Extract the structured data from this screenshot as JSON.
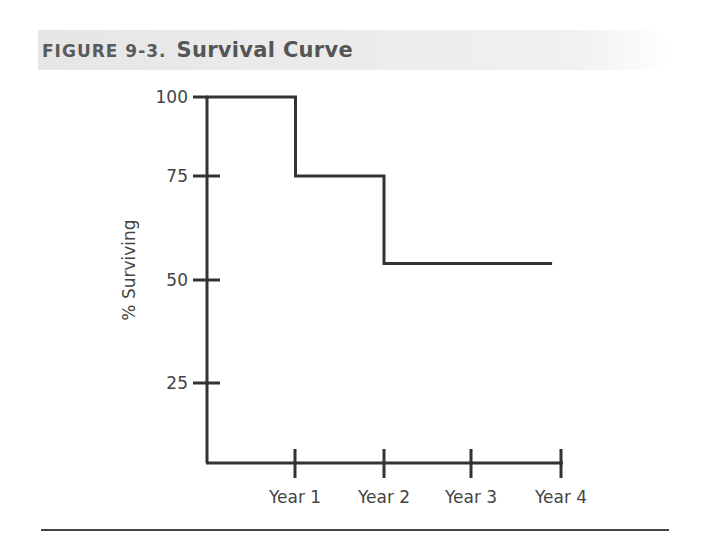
{
  "figure": {
    "label": "FIGURE 9-3.",
    "title": "Survival Curve"
  },
  "chart_data": {
    "type": "line",
    "step": true,
    "title": "Survival Curve",
    "xlabel": "",
    "ylabel": "% Surviving",
    "categories": [
      "Start",
      "Year 1",
      "Year 2",
      "Year 3",
      "Year 4"
    ],
    "x_tick_labels": [
      "Year 1",
      "Year 2",
      "Year 3",
      "Year 4"
    ],
    "y_tick_labels": [
      "25",
      "50",
      "75",
      "100"
    ],
    "y_ticks": [
      25,
      50,
      75,
      100
    ],
    "series": [
      {
        "name": "Survival",
        "x": [
          0,
          1,
          1,
          2,
          2,
          3.9
        ],
        "values": [
          100,
          100,
          75,
          75,
          54,
          54
        ]
      }
    ],
    "ylim": [
      0,
      100
    ],
    "xlim": [
      0,
      4
    ],
    "grid": false,
    "legend": "none"
  },
  "colors": {
    "line": "#333333",
    "title_text": "#5a5a5a",
    "title_bg": "#e8e8e8"
  }
}
